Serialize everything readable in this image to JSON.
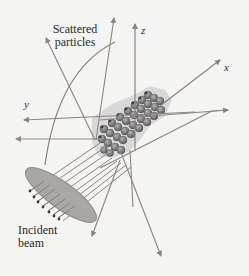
{
  "diagram": {
    "labels": {
      "scattered_line1": "Scattered",
      "scattered_line2": "particles",
      "incident_line1": "Incident",
      "incident_line2": "beam"
    },
    "axes": {
      "x": "x",
      "y": "y",
      "z": "z"
    },
    "colors": {
      "background": "#f4f4f2",
      "ray": "#8a8585",
      "ellipse_fill": "#a9a6a6",
      "ellipse_stroke": "#8f8b8b",
      "particle_dark": "#4a4a4a",
      "particle_mid": "#8c8c8c",
      "particle_halo": "#c9c9c9",
      "text": "#2b2b2b"
    }
  }
}
